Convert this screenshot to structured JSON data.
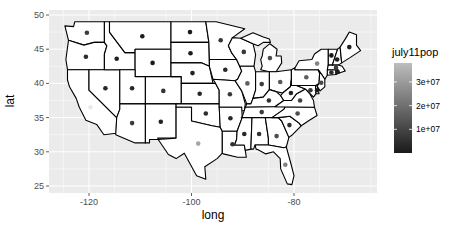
{
  "chart_data": {
    "type": "scatter",
    "subtype": "choropleth-outline map with state centroid points",
    "title": "",
    "xlabel": "long",
    "ylabel": "lat",
    "xlim": [
      -127,
      -64
    ],
    "ylim": [
      24.5,
      50.5
    ],
    "x_ticks": [
      -120,
      -100,
      -80
    ],
    "y_ticks": [
      25,
      30,
      35,
      40,
      45,
      50
    ],
    "grid": true,
    "legend": {
      "title": "july11pop",
      "type": "colorbar",
      "position": "right",
      "ticks": [
        "1e+07",
        "2e+07",
        "3e+07"
      ],
      "low_color": "#132B43",
      "high_color": "#b8b8b8"
    },
    "points": [
      {
        "state": "WA",
        "long": -120.4,
        "lat": 47.4,
        "pop": 6830000
      },
      {
        "state": "OR",
        "long": -120.6,
        "lat": 43.9,
        "pop": 3870000
      },
      {
        "state": "CA",
        "long": -119.7,
        "lat": 36.5,
        "pop": 37690000
      },
      {
        "state": "NV",
        "long": -116.8,
        "lat": 39.3,
        "pop": 2720000
      },
      {
        "state": "ID",
        "long": -114.6,
        "lat": 43.6,
        "pop": 1580000
      },
      {
        "state": "MT",
        "long": -109.6,
        "lat": 46.9,
        "pop": 998000
      },
      {
        "state": "WY",
        "long": -107.6,
        "lat": 43.0,
        "pop": 568000
      },
      {
        "state": "UT",
        "long": -111.6,
        "lat": 39.3,
        "pop": 2820000
      },
      {
        "state": "AZ",
        "long": -111.6,
        "lat": 34.2,
        "pop": 6480000
      },
      {
        "state": "CO",
        "long": -105.5,
        "lat": 38.9,
        "pop": 5120000
      },
      {
        "state": "NM",
        "long": -106.0,
        "lat": 34.4,
        "pop": 2080000
      },
      {
        "state": "ND",
        "long": -100.3,
        "lat": 47.5,
        "pop": 684000
      },
      {
        "state": "SD",
        "long": -100.2,
        "lat": 44.4,
        "pop": 824000
      },
      {
        "state": "NE",
        "long": -99.8,
        "lat": 41.5,
        "pop": 1840000
      },
      {
        "state": "KS",
        "long": -98.4,
        "lat": 38.5,
        "pop": 2870000
      },
      {
        "state": "OK",
        "long": -97.2,
        "lat": 35.6,
        "pop": 3790000
      },
      {
        "state": "TX",
        "long": -98.7,
        "lat": 31.2,
        "pop": 25670000
      },
      {
        "state": "MN",
        "long": -94.3,
        "lat": 46.3,
        "pop": 5340000
      },
      {
        "state": "IA",
        "long": -93.4,
        "lat": 42.0,
        "pop": 3060000
      },
      {
        "state": "MO",
        "long": -92.5,
        "lat": 38.4,
        "pop": 6010000
      },
      {
        "state": "AR",
        "long": -92.4,
        "lat": 34.9,
        "pop": 2940000
      },
      {
        "state": "LA",
        "long": -92.0,
        "lat": 31.1,
        "pop": 4570000
      },
      {
        "state": "WI",
        "long": -89.8,
        "lat": 44.6,
        "pop": 5710000
      },
      {
        "state": "IL",
        "long": -89.1,
        "lat": 40.0,
        "pop": 12860000
      },
      {
        "state": "MI",
        "long": -84.7,
        "lat": 43.7,
        "pop": 9880000
      },
      {
        "state": "IN",
        "long": -86.3,
        "lat": 39.9,
        "pop": 6520000
      },
      {
        "state": "OH",
        "long": -82.7,
        "lat": 40.2,
        "pop": 11540000
      },
      {
        "state": "KY",
        "long": -84.9,
        "lat": 37.5,
        "pop": 4370000
      },
      {
        "state": "TN",
        "long": -86.3,
        "lat": 35.8,
        "pop": 6400000
      },
      {
        "state": "MS",
        "long": -89.7,
        "lat": 32.6,
        "pop": 2980000
      },
      {
        "state": "AL",
        "long": -86.8,
        "lat": 32.6,
        "pop": 4800000
      },
      {
        "state": "GA",
        "long": -83.4,
        "lat": 32.3,
        "pop": 9820000
      },
      {
        "state": "FL",
        "long": -81.7,
        "lat": 28.1,
        "pop": 19060000
      },
      {
        "state": "SC",
        "long": -80.9,
        "lat": 33.9,
        "pop": 4680000
      },
      {
        "state": "NC",
        "long": -79.3,
        "lat": 35.6,
        "pop": 9650000
      },
      {
        "state": "VA",
        "long": -78.8,
        "lat": 37.5,
        "pop": 8100000
      },
      {
        "state": "WV",
        "long": -80.6,
        "lat": 38.6,
        "pop": 1860000
      },
      {
        "state": "PA",
        "long": -77.6,
        "lat": 40.9,
        "pop": 12740000
      },
      {
        "state": "NY",
        "long": -75.5,
        "lat": 42.9,
        "pop": 19470000
      },
      {
        "state": "MD",
        "long": -76.8,
        "lat": 39.0,
        "pop": 5830000
      },
      {
        "state": "DE",
        "long": -75.5,
        "lat": 39.0,
        "pop": 907000
      },
      {
        "state": "NJ",
        "long": -74.7,
        "lat": 40.1,
        "pop": 8820000
      },
      {
        "state": "CT",
        "long": -72.7,
        "lat": 41.6,
        "pop": 3580000
      },
      {
        "state": "RI",
        "long": -71.5,
        "lat": 41.7,
        "pop": 1050000
      },
      {
        "state": "MA",
        "long": -71.8,
        "lat": 42.3,
        "pop": 6590000
      },
      {
        "state": "VT",
        "long": -72.7,
        "lat": 44.1,
        "pop": 626000
      },
      {
        "state": "NH",
        "long": -71.6,
        "lat": 43.5,
        "pop": 1320000
      },
      {
        "state": "ME",
        "long": -69.2,
        "lat": 45.3,
        "pop": 1330000
      }
    ]
  },
  "labels": {
    "xlabel": "long",
    "ylabel": "lat",
    "legend_title": "july11pop",
    "x_ticks": [
      "-120",
      "-100",
      "-80"
    ],
    "y_ticks": [
      "50",
      "45",
      "40",
      "35",
      "30",
      "25"
    ],
    "legend_ticks": [
      "3e+07",
      "2e+07",
      "1e+07"
    ]
  }
}
